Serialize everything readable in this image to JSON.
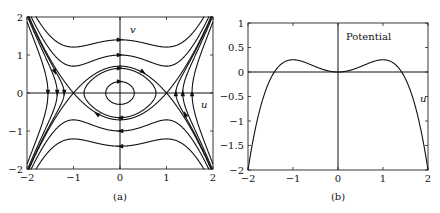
{
  "chart_data": [
    {
      "id": "a",
      "type": "line",
      "subtype": "phase-portrait",
      "caption": "(a)",
      "xlabel": "u",
      "ylabel": "v",
      "xlim": [
        -2,
        2
      ],
      "ylim": [
        -2,
        2
      ],
      "xticks": [
        "-2",
        "-1",
        "0",
        "1",
        "2"
      ],
      "yticks": [
        "-2",
        "-1",
        "0",
        "1",
        "2"
      ],
      "xtick_values": [
        -2,
        -1,
        0,
        1,
        2
      ],
      "ytick_values": [
        -2,
        -1,
        0,
        1,
        2
      ],
      "energy_function": "E = v^2/2 + u^2/2 - u^4/4",
      "saddle_points": [
        [
          -1,
          0
        ],
        [
          1,
          0
        ]
      ],
      "center_point": [
        0,
        0
      ],
      "level_sets": [
        {
          "E": 0.98,
          "description": "open orbits crossing v=±1.4 at u=0"
        },
        {
          "E": 0.5,
          "description": "open orbits crossing v=±1.0 at u=0"
        },
        {
          "E": 0.25,
          "description": "separatrix through saddles (±1,0)"
        },
        {
          "E": 0.21,
          "description": "closed orbit crossing v≈±0.65"
        },
        {
          "E": 0.045,
          "description": "small closed orbit around origin"
        },
        {
          "E": 0.2016,
          "description": "side orbits crossing u=±1.2"
        },
        {
          "E": 0.081,
          "description": "side orbits crossing u=±1.35"
        },
        {
          "E": -0.24,
          "description": "side orbits crossing u=±1.55"
        }
      ],
      "grid": false
    },
    {
      "id": "b",
      "type": "line",
      "caption": "(b)",
      "title": "Potential",
      "xlabel": "u",
      "ylabel": "",
      "xlim": [
        -2,
        2
      ],
      "ylim": [
        -2,
        1
      ],
      "xticks": [
        "-2",
        "-1",
        "0",
        "1",
        "2"
      ],
      "yticks": [
        "1",
        "0.5",
        "0",
        "-0.5",
        "-1",
        "-1.5",
        "-2"
      ],
      "xtick_values": [
        -2,
        -1,
        0,
        1,
        2
      ],
      "ytick_values": [
        1,
        0.5,
        0,
        -0.5,
        -1,
        -1.5,
        -2
      ],
      "function": "V(u) = u^2/2 - u^4/4",
      "x": [
        -2,
        -1.75,
        -1.5,
        -1.414,
        -1.25,
        -1,
        -0.75,
        -0.5,
        -0.25,
        0,
        0.25,
        0.5,
        0.75,
        1,
        1.25,
        1.414,
        1.5,
        1.75,
        2
      ],
      "y": [
        -2.0,
        -0.81,
        -0.14,
        0.0,
        0.17,
        0.25,
        0.2,
        0.11,
        0.03,
        0.0,
        0.03,
        0.11,
        0.2,
        0.25,
        0.17,
        0.0,
        -0.14,
        -0.81,
        -2.0
      ],
      "grid": false
    }
  ],
  "plot_a": {
    "caption": "(a)",
    "xlabel": "u",
    "ylabel": "v",
    "xticks": [
      "-2",
      "-1",
      "0",
      "1",
      "2"
    ],
    "yticks": [
      "-2",
      "-1",
      "0",
      "1",
      "2"
    ]
  },
  "plot_b": {
    "caption": "(b)",
    "title": "Potential",
    "xlabel": "u",
    "xticks": [
      "-2",
      "-1",
      "0",
      "1",
      "2"
    ],
    "yticks": [
      "1",
      "0.5",
      "0",
      "-0.5",
      "-1",
      "-1.5",
      "-2"
    ]
  }
}
